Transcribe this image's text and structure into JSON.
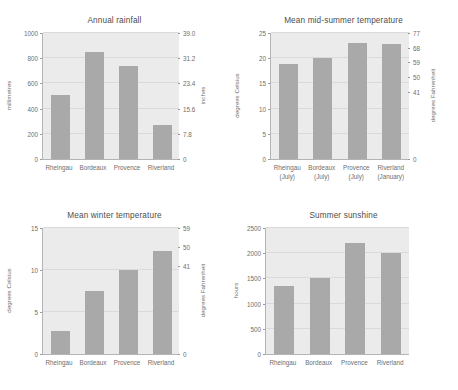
{
  "figure": {
    "background": "#ffffff",
    "bar_color": "#a9a9a9",
    "plot_background": "#ebebeb",
    "axis_color": "#b4b4b4",
    "text_color": "#6e6e6e"
  },
  "chart_data": [
    {
      "type": "bar",
      "title": "Annual rainfall",
      "panel": "top-left",
      "categories": [
        "Rheingau",
        "Bordeaux",
        "Provence",
        "Riverland"
      ],
      "values": [
        510,
        850,
        735,
        270
      ],
      "xlabel": "",
      "ylabel": "millimetres",
      "ylim": [
        0,
        1000
      ],
      "yticks": [
        0,
        200,
        400,
        600,
        800,
        1000
      ],
      "ytick_labels": [
        "0",
        "200",
        "400",
        "600",
        "800",
        "1000"
      ],
      "secondary_axis": {
        "label": "inches",
        "lim": [
          0,
          39.0
        ],
        "ticks": [
          0,
          7.8,
          15.6,
          23.4,
          31.2,
          39.0
        ],
        "tick_labels": [
          "0",
          "7.8",
          "15.6",
          "23.4",
          "31.2",
          "39.0"
        ]
      },
      "grid": true,
      "legend": "none"
    },
    {
      "type": "bar",
      "title": "Mean mid-summer temperature",
      "panel": "top-right",
      "categories": [
        "Rheingau\n(July)",
        "Bordeaux\n(July)",
        "Provence\n(July)",
        "Riverland\n(January)"
      ],
      "category_lines": [
        [
          "Rheingau",
          "(July)"
        ],
        [
          "Bordeaux",
          "(July)"
        ],
        [
          "Provence",
          "(July)"
        ],
        [
          "Riverland",
          "(January)"
        ]
      ],
      "values": [
        18.8,
        20.0,
        23.0,
        22.8
      ],
      "xlabel": "",
      "ylabel": "degrees Celsius",
      "ylim": [
        0,
        25
      ],
      "yticks": [
        0,
        5,
        10,
        15,
        20,
        25
      ],
      "ytick_labels": [
        "0",
        "5",
        "10",
        "15",
        "20",
        "25"
      ],
      "secondary_axis": {
        "label": "degrees Fahrenheit",
        "lim": [
          0,
          77
        ],
        "ticks": [
          0,
          41,
          50,
          59,
          68,
          77
        ],
        "tick_labels": [
          "0",
          "41",
          "50",
          "59",
          "68",
          "77"
        ]
      },
      "grid": true,
      "legend": "none"
    },
    {
      "type": "bar",
      "title": "Mean winter temperature",
      "panel": "bottom-left",
      "categories": [
        "Rheingau",
        "Bordeaux",
        "Provence",
        "Riverland"
      ],
      "values": [
        2.7,
        7.5,
        10.0,
        12.3
      ],
      "xlabel": "",
      "ylabel": "degrees Celsius",
      "ylim": [
        0,
        15
      ],
      "yticks": [
        0,
        5,
        10,
        15
      ],
      "ytick_labels": [
        "0",
        "5",
        "10",
        "15"
      ],
      "secondary_axis": {
        "label": "degrees Fahrenheit",
        "lim": [
          0,
          59
        ],
        "ticks": [
          0,
          41,
          50,
          59
        ],
        "tick_labels": [
          "0",
          "41",
          "50",
          "59"
        ]
      },
      "grid": true,
      "legend": "none"
    },
    {
      "type": "bar",
      "title": "Summer sunshine",
      "panel": "bottom-right",
      "categories": [
        "Rheingau",
        "Bordeaux",
        "Provence",
        "Riverland"
      ],
      "values": [
        1340,
        1500,
        2210,
        2010
      ],
      "xlabel": "",
      "ylabel": "hours",
      "ylim": [
        0,
        2500
      ],
      "yticks": [
        0,
        500,
        1000,
        1500,
        2000,
        2500
      ],
      "ytick_labels": [
        "0",
        "500",
        "1000",
        "1500",
        "2000",
        "2500"
      ],
      "secondary_axis": null,
      "grid": true,
      "legend": "none"
    }
  ]
}
